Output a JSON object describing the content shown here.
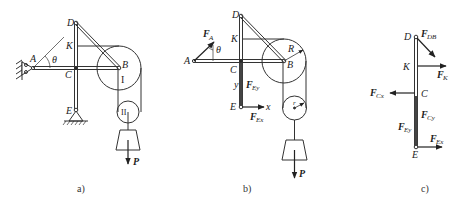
{
  "figure": {
    "panels": [
      {
        "id": "a",
        "caption": "a)",
        "points": {
          "A": "A",
          "B": "B",
          "C": "C",
          "D": "D",
          "E": "E",
          "K": "K"
        },
        "angle_label": "θ",
        "pulley_labels": {
          "big": "I",
          "small": "II"
        },
        "load_label": "P"
      },
      {
        "id": "b",
        "caption": "b)",
        "points": {
          "A": "A",
          "B": "B",
          "C": "C",
          "D": "D",
          "E": "E",
          "K": "K"
        },
        "angle_label": "θ",
        "radius_labels": {
          "big": "R",
          "small": "r"
        },
        "axes": {
          "x": "x",
          "y": "y"
        },
        "forces": {
          "FA": {
            "main": "F",
            "sub": "A"
          },
          "FEy": {
            "main": "F",
            "sub": "Ey"
          },
          "FEx": {
            "main": "F",
            "sub": "Ex"
          }
        },
        "load_label": "P"
      },
      {
        "id": "c",
        "caption": "c)",
        "points": {
          "C": "C",
          "D": "D",
          "E": "E",
          "K": "K"
        },
        "forces": {
          "FDB": {
            "main": "F",
            "sub": "DB"
          },
          "FK": {
            "main": "F",
            "sub": "K"
          },
          "FCx": {
            "main": "F",
            "sub": "Cx"
          },
          "FCy": {
            "main": "F",
            "sub": "Cy"
          },
          "FEy": {
            "main": "F",
            "sub": "Ey"
          },
          "FEx": {
            "main": "F",
            "sub": "Ex"
          }
        }
      }
    ],
    "colors": {
      "line": "#333333",
      "thick": "#222222",
      "background": "#ffffff"
    }
  }
}
